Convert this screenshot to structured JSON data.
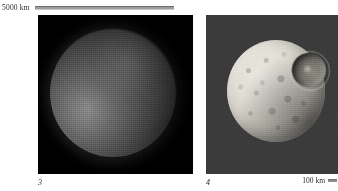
{
  "figure": {
    "type": "two-panel-astronomical-image-plate",
    "background_color": "#ffffff"
  },
  "top_scalebar": {
    "label": "5000 km",
    "bar_color": "#9d9d9d",
    "bar_name": "scale-rule"
  },
  "bottom_scalebar": {
    "label": "100 km",
    "bar_color": "#8f8f8f",
    "bar_name": "scale-rule"
  },
  "panels": [
    {
      "id": "panel-left",
      "caption": "3",
      "background_color": "#000000",
      "body_name": "dim-icy-moon-disk",
      "description": "low-contrast grainy grey disk, illuminated from lower-left, on black sky"
    },
    {
      "id": "panel-right",
      "caption": "4",
      "background_color": "#3b3b3b",
      "body_name": "cratered-moon-disk",
      "crater_name": "large-impact-crater",
      "description": "bright heavily cratered moon with one very large impact crater on the upper-right limb, on mid-grey noisy background"
    }
  ]
}
